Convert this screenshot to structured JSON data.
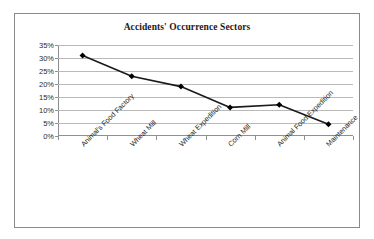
{
  "chart_data": {
    "type": "line",
    "title": "Accidents' Occurrence Sectors",
    "xlabel": "",
    "ylabel": "",
    "categories": [
      "Animal's Food Factory",
      "Wheat Mill",
      "Wheat Expedition",
      "Corn Mill",
      "Animal Food Expedition",
      "Maintenance"
    ],
    "values": [
      31,
      23,
      19,
      11,
      12,
      4.5
    ],
    "ylim": [
      0,
      35
    ],
    "ytick_labels": [
      "0%",
      "5%",
      "10%",
      "15%",
      "20%",
      "25%",
      "30%",
      "35%"
    ],
    "ytick_values": [
      0,
      5,
      10,
      15,
      20,
      25,
      30,
      35
    ],
    "grid": true,
    "legend": false,
    "legend_position": "none",
    "series": [
      {
        "name": "Accidents",
        "values": [
          31,
          23,
          19,
          11,
          12,
          4.5
        ],
        "line_color": "#1a1a1a",
        "marker": "diamond",
        "marker_color": "#000000"
      }
    ],
    "colors": {
      "line": "#1a1a1a",
      "marker": "#000000",
      "grid": "#b9b9b9",
      "axis": "#8f8f8f",
      "border": "#8a8a8a",
      "background": "#ffffff",
      "text": "#262626"
    }
  }
}
